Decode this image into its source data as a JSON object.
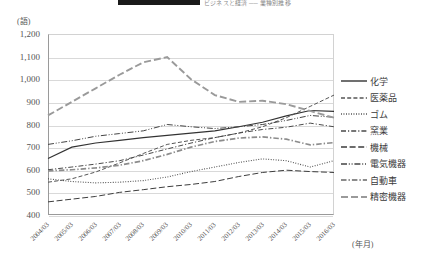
{
  "header": {
    "title_suffix": "ビジネスと経済 ── 業種別推移"
  },
  "axes": {
    "y_unit": "(語)",
    "x_unit": "(年月)",
    "y_ticks": [
      "1,200",
      "1,100",
      "1,000",
      "900",
      "800",
      "700",
      "600",
      "500",
      "400"
    ]
  },
  "legend": {
    "items": [
      {
        "label": "化学",
        "style": "solid"
      },
      {
        "label": "医薬品",
        "style": "dashed"
      },
      {
        "label": "ゴム",
        "style": "dotted"
      },
      {
        "label": "窯業",
        "style": "dash-dot"
      },
      {
        "label": "機械",
        "style": "long-dash"
      },
      {
        "label": "電気機器",
        "style": "dash-dot-dot"
      },
      {
        "label": "自動車",
        "style": "dash-dot-thick"
      },
      {
        "label": "精密機器",
        "style": "long-dash-thick"
      }
    ]
  },
  "chart_data": {
    "type": "line",
    "title": "ビジネスと経済 ── 業種別推移",
    "xlabel": "(年月)",
    "ylabel": "(語)",
    "ylim": [
      400,
      1200
    ],
    "ytick_step": 100,
    "grid": true,
    "legend_position": "right",
    "categories": [
      "2004/03",
      "2005/03",
      "2006/03",
      "2007/03",
      "2008/03",
      "2009/03",
      "2010/03",
      "2011/03",
      "2012/03",
      "2013/03",
      "2014/03",
      "2015/03",
      "2016/03"
    ],
    "series": [
      {
        "name": "化学",
        "style": "solid",
        "values": [
          650,
          700,
          718,
          730,
          742,
          752,
          762,
          772,
          790,
          810,
          838,
          862,
          858
        ]
      },
      {
        "name": "医薬品",
        "style": "dashed",
        "values": [
          545,
          560,
          590,
          630,
          672,
          712,
          730,
          742,
          762,
          790,
          830,
          880,
          930
        ]
      },
      {
        "name": "ゴム",
        "style": "dotted",
        "values": [
          560,
          548,
          542,
          545,
          552,
          568,
          592,
          612,
          632,
          648,
          640,
          612,
          640
        ]
      },
      {
        "name": "窯業",
        "style": "dash-dot",
        "values": [
          600,
          612,
          625,
          640,
          665,
          692,
          718,
          742,
          762,
          778,
          788,
          806,
          790
        ]
      },
      {
        "name": "機械",
        "style": "long-dash",
        "values": [
          458,
          470,
          482,
          500,
          512,
          525,
          535,
          548,
          570,
          588,
          598,
          592,
          588
        ]
      },
      {
        "name": "電気機器",
        "style": "dash-dot-dot",
        "values": [
          712,
          728,
          748,
          760,
          772,
          800,
          790,
          782,
          790,
          800,
          818,
          840,
          832
        ]
      },
      {
        "name": "自動車",
        "style": "dash-dot-thick",
        "values": [
          595,
          600,
          608,
          620,
          640,
          668,
          700,
          725,
          740,
          745,
          735,
          710,
          720
        ]
      },
      {
        "name": "精密機器",
        "style": "long-dash-thick",
        "values": [
          840,
          900,
          960,
          1020,
          1075,
          1098,
          1000,
          930,
          900,
          905,
          890,
          860,
          830
        ]
      }
    ]
  }
}
